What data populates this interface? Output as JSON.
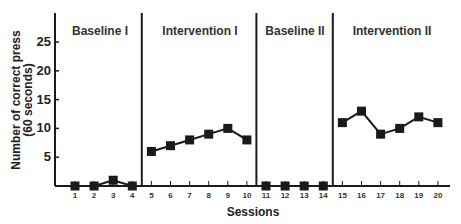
{
  "chart_data": {
    "type": "line",
    "title": "",
    "xlabel": "Sessions",
    "ylabel": "Number of correct press (60 seconds)",
    "ylabel_lines": [
      "Number of correct press",
      "(60 seconds)"
    ],
    "ylim": [
      0,
      30
    ],
    "y_ticks": [
      5,
      10,
      15,
      20,
      25
    ],
    "x_ticks": [
      1,
      2,
      3,
      4,
      5,
      6,
      7,
      8,
      9,
      10,
      11,
      12,
      13,
      14,
      15,
      16,
      17,
      18,
      19,
      20
    ],
    "grid": false,
    "legend": null,
    "marker": "square",
    "phases": [
      {
        "label": "Baseline I",
        "sessions": [
          1,
          2,
          3,
          4
        ],
        "values": [
          0,
          0,
          1,
          0
        ]
      },
      {
        "label": "Intervention I",
        "sessions": [
          5,
          6,
          7,
          8,
          9,
          10
        ],
        "values": [
          6,
          7,
          8,
          9,
          10,
          8
        ]
      },
      {
        "label": "Baseline II",
        "sessions": [
          11,
          12,
          13,
          14
        ],
        "values": [
          0,
          0,
          0,
          0
        ]
      },
      {
        "label": "Intervention  II",
        "sessions": [
          15,
          16,
          17,
          18,
          19,
          20
        ],
        "values": [
          11,
          13,
          9,
          10,
          12,
          11
        ]
      }
    ],
    "phase_change_lines_after_session": [
      4,
      10,
      14
    ]
  },
  "colors": {
    "line": "#1a1a1a",
    "text": "#222222",
    "background": "#ffffff"
  }
}
